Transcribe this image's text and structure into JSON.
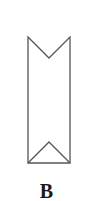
{
  "figure": {
    "label": "B",
    "stroke_color": "#555555",
    "fill_color": "#ffffff",
    "shape": {
      "outline_points": [
        [
          28,
          37
        ],
        [
          49,
          58
        ],
        [
          70,
          37
        ],
        [
          70,
          163
        ],
        [
          28,
          163
        ]
      ],
      "bottom_triangle_points": [
        [
          28,
          163
        ],
        [
          49,
          142
        ],
        [
          70,
          163
        ]
      ]
    }
  }
}
